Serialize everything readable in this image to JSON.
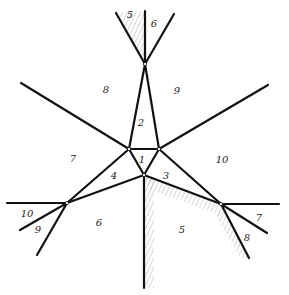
{
  "diagram": {
    "type": "planar-graph",
    "colors": {
      "background": "#ffffff",
      "edge": "#111111",
      "hatch": "#8a8a8a",
      "label": "#222222"
    },
    "nodes": [
      {
        "id": "top",
        "x": 145,
        "y": 64
      },
      {
        "id": "inner-left",
        "x": 129,
        "y": 149
      },
      {
        "id": "inner-right",
        "x": 159,
        "y": 149
      },
      {
        "id": "inner-bottom",
        "x": 144,
        "y": 175
      },
      {
        "id": "left",
        "x": 67,
        "y": 203
      },
      {
        "id": "right",
        "x": 221,
        "y": 204
      }
    ],
    "edges": [
      {
        "x1": 116,
        "y1": 13,
        "x2": 145,
        "y2": 64
      },
      {
        "x1": 145,
        "y1": 11,
        "x2": 145,
        "y2": 64
      },
      {
        "x1": 174,
        "y1": 14,
        "x2": 145,
        "y2": 64
      },
      {
        "x1": 145,
        "y1": 64,
        "x2": 129,
        "y2": 149
      },
      {
        "x1": 145,
        "y1": 64,
        "x2": 159,
        "y2": 149
      },
      {
        "x1": 129,
        "y1": 149,
        "x2": 159,
        "y2": 149
      },
      {
        "x1": 129,
        "y1": 149,
        "x2": 144,
        "y2": 175
      },
      {
        "x1": 159,
        "y1": 149,
        "x2": 144,
        "y2": 175
      },
      {
        "x1": 21,
        "y1": 83,
        "x2": 129,
        "y2": 149
      },
      {
        "x1": 268,
        "y1": 85,
        "x2": 159,
        "y2": 149
      },
      {
        "x1": 129,
        "y1": 149,
        "x2": 67,
        "y2": 203
      },
      {
        "x1": 144,
        "y1": 175,
        "x2": 67,
        "y2": 203
      },
      {
        "x1": 159,
        "y1": 149,
        "x2": 221,
        "y2": 204
      },
      {
        "x1": 144,
        "y1": 175,
        "x2": 221,
        "y2": 204
      },
      {
        "x1": 144,
        "y1": 175,
        "x2": 144,
        "y2": 288
      },
      {
        "x1": 7,
        "y1": 203,
        "x2": 67,
        "y2": 203
      },
      {
        "x1": 20,
        "y1": 230,
        "x2": 67,
        "y2": 203
      },
      {
        "x1": 37,
        "y1": 255,
        "x2": 67,
        "y2": 203
      },
      {
        "x1": 279,
        "y1": 204,
        "x2": 221,
        "y2": 204
      },
      {
        "x1": 267,
        "y1": 233,
        "x2": 221,
        "y2": 204
      },
      {
        "x1": 249,
        "y1": 258,
        "x2": 221,
        "y2": 204
      }
    ],
    "regions": [
      {
        "label": "5",
        "x": 130,
        "y": 18
      },
      {
        "label": "6",
        "x": 154,
        "y": 27
      },
      {
        "label": "8",
        "x": 106,
        "y": 93
      },
      {
        "label": "9",
        "x": 177,
        "y": 94
      },
      {
        "label": "2",
        "x": 141,
        "y": 126
      },
      {
        "label": "1",
        "x": 142,
        "y": 163
      },
      {
        "label": "7",
        "x": 73,
        "y": 162
      },
      {
        "label": "4",
        "x": 114,
        "y": 179
      },
      {
        "label": "3",
        "x": 166,
        "y": 179
      },
      {
        "label": "10",
        "x": 222,
        "y": 163
      },
      {
        "label": "10",
        "x": 27,
        "y": 217
      },
      {
        "label": "9",
        "x": 38,
        "y": 233
      },
      {
        "label": "6",
        "x": 99,
        "y": 226
      },
      {
        "label": "5",
        "x": 182,
        "y": 233
      },
      {
        "label": "7",
        "x": 259,
        "y": 221
      },
      {
        "label": "8",
        "x": 247,
        "y": 241
      }
    ]
  }
}
